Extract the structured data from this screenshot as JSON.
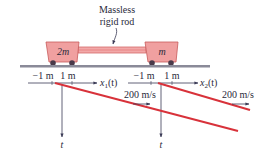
{
  "diagram": {
    "rod_label_line1": "Massless",
    "rod_label_line2": "rigid rod",
    "cart_left_mass": "2m",
    "cart_right_mass": "m",
    "axis1": {
      "tick_neg": "−1 m",
      "tick_pos": "1 m",
      "label_var": "x",
      "label_sub": "1",
      "label_arg": "(t)"
    },
    "axis2": {
      "tick_neg": "−1 m",
      "tick_pos": "1 m",
      "label_var": "x",
      "label_sub": "2",
      "label_arg": "(t)"
    },
    "time_axis_label_1": "t",
    "time_axis_label_2": "t",
    "speed_label_1": "200 m/s",
    "speed_label_2": "200 m/s",
    "colors": {
      "cart_fill": "#f0a0a0",
      "cart_stroke": "#c85a5a",
      "rod": "#e06868",
      "ground": "#8a8a98",
      "wheel": "#4a3a4a",
      "worldline": "#d8323a",
      "axis": "#3a3a55",
      "text": "#2a2a3a"
    }
  }
}
